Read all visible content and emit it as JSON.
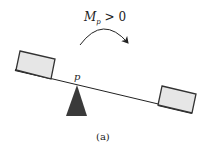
{
  "diagram": {
    "moment_label": {
      "symbol": "M",
      "subscript": "p",
      "relation": " > 0"
    },
    "pivot_label": "p",
    "caption": "(a)",
    "colors": {
      "stroke": "#222222",
      "box_fill": "#e6e6e6",
      "fulcrum_fill": "#3a3a3a",
      "background": "#ffffff"
    },
    "elements": [
      "seesaw-beam",
      "left-weight-box",
      "right-weight-box",
      "fulcrum-triangle",
      "clockwise-moment-arrow"
    ]
  }
}
